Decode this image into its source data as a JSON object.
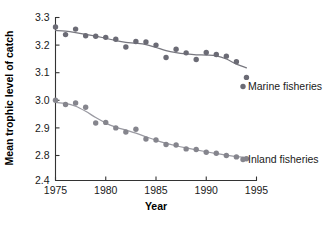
{
  "chart_data": {
    "type": "scatter",
    "title": "",
    "xlabel": "Year",
    "ylabel": "Mean trophic level of catch",
    "xlim": [
      1975,
      1995
    ],
    "ylim": [
      2.4,
      3.3
    ],
    "grid": false,
    "legend_position": "right-inline",
    "xticks": [
      1975,
      1980,
      1985,
      1990,
      1995
    ],
    "xticklabels": [
      "1975",
      "1980",
      "1985",
      "1990",
      "1995"
    ],
    "yticks": [
      2.4,
      2.8,
      2.9,
      3.0,
      3.1,
      3.2,
      3.3
    ],
    "yticklabels": [
      "2.4",
      "2.8",
      "2.9",
      "3.0",
      "3.1",
      "3.2",
      "3.3"
    ],
    "y_axis_break": true,
    "y_axis_break_note": "Axis compressed between 2.4 and 2.8",
    "x": [
      1975,
      1976,
      1977,
      1978,
      1979,
      1980,
      1981,
      1982,
      1983,
      1984,
      1985,
      1986,
      1987,
      1988,
      1989,
      1990,
      1991,
      1992,
      1993,
      1994
    ],
    "series": [
      {
        "name": "Marine fisheries",
        "label": "Marine fisheries",
        "color": "#6b6b75",
        "curve_color": "#77777f",
        "values": [
          3.266,
          3.238,
          3.258,
          3.234,
          3.232,
          3.228,
          3.221,
          3.193,
          3.213,
          3.211,
          3.2,
          3.155,
          3.185,
          3.172,
          3.148,
          3.173,
          3.166,
          3.16,
          3.14,
          3.083
        ]
      },
      {
        "name": "Inland fisheries",
        "label": "Inland fisheries",
        "color": "#85858d",
        "curve_color": "#9a9aa2",
        "values": [
          3.0,
          2.985,
          2.99,
          2.975,
          2.918,
          2.92,
          2.9,
          2.885,
          2.895,
          2.86,
          2.856,
          2.84,
          2.838,
          2.824,
          2.822,
          2.812,
          2.808,
          2.8,
          2.795,
          2.788
        ]
      }
    ]
  },
  "axes": {
    "y_title": "Mean trophic level of catch",
    "x_title": "Year"
  },
  "labels": {
    "marine": "Marine fisheries",
    "inland": "Inland fisheries"
  }
}
